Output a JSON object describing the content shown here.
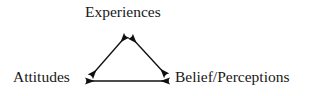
{
  "diagram": {
    "background_color": "#ffffff",
    "line_color": "#101010",
    "text_color": "#181818",
    "nodes": [
      {
        "id": "experiences",
        "label": "Experiences",
        "position": "top"
      },
      {
        "id": "attitudes",
        "label": "Attitudes",
        "position": "bottom-left"
      },
      {
        "id": "belief",
        "label": "Belief/Perceptions",
        "position": "bottom-right"
      }
    ],
    "edges": [
      {
        "id": "attitudes-experiences",
        "from": "attitudes",
        "to": "experiences",
        "style": "double-headed",
        "x1": 91,
        "y1": 76,
        "x2": 126,
        "y2": 36
      },
      {
        "id": "experiences-belief",
        "from": "experiences",
        "to": "belief",
        "style": "double-headed",
        "x1": 131,
        "y1": 37,
        "x2": 166,
        "y2": 75
      },
      {
        "id": "attitudes-belief",
        "from": "attitudes",
        "to": "belief",
        "style": "double-headed",
        "x1": 86,
        "y1": 81,
        "x2": 169,
        "y2": 81
      }
    ]
  }
}
